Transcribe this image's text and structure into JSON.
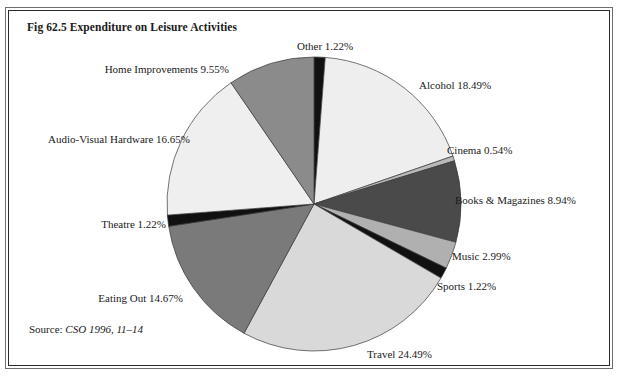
{
  "figure": {
    "title": "Fig 62.5 Expenditure on Leisure Activities",
    "source_prefix": "Source:",
    "source_citation": "CSO 1996, 11–14"
  },
  "chart_data": {
    "type": "pie",
    "title": "Fig 62.5 Expenditure on Leisure Activities",
    "xlabel": "",
    "ylabel": "",
    "units": "percent",
    "start_angle_deg": 0,
    "direction": "clockwise",
    "legend": "none",
    "labels_position": "outside",
    "categories": [
      "Other",
      "Alcohol",
      "Cinema",
      "Books & Magazines",
      "Music",
      "Sports",
      "Travel",
      "Eating Out",
      "Theatre",
      "Audio-Visual Hardware",
      "Home Improvements"
    ],
    "values": [
      1.22,
      18.49,
      0.54,
      8.94,
      2.99,
      1.22,
      24.49,
      14.67,
      1.22,
      16.65,
      9.55
    ],
    "colors": [
      "#111111",
      "#eeeeee",
      "#b9b9b9",
      "#4a4a4a",
      "#b0b0b0",
      "#111111",
      "#d9d9d9",
      "#7a7a7a",
      "#111111",
      "#efefef",
      "#8b8b8b"
    ],
    "slice_labels": [
      "Other 1.22%",
      "Alcohol 18.49%",
      "Cinema 0.54%",
      "Books & Magazines 8.94%",
      "Music 2.99%",
      "Sports 1.22%",
      "Travel 24.49%",
      "Eating Out 14.67%",
      "Theatre 1.22%",
      "Audio-Visual Hardware 16.65%",
      "Home Improvements 9.55%"
    ],
    "total": 100.0
  },
  "labels": {
    "other": "Other 1.22%",
    "alcohol": "Alcohol 18.49%",
    "cinema": "Cinema 0.54%",
    "books": "Books & Magazines 8.94%",
    "music": "Music 2.99%",
    "sports": "Sports 1.22%",
    "travel": "Travel 24.49%",
    "eating_out": "Eating Out 14.67%",
    "theatre": "Theatre 1.22%",
    "audio_visual": "Audio-Visual Hardware 16.65%",
    "home_improvements": "Home Improvements 9.55%"
  }
}
